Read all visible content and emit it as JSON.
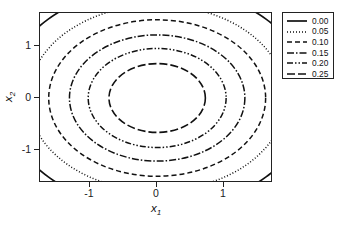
{
  "chart_data": {
    "type": "line",
    "subtype": "contour",
    "title": "",
    "xlabel": "x1",
    "ylabel": "x2",
    "xlabel_base": "x",
    "xlabel_sub": "1",
    "ylabel_base": "x",
    "ylabel_sub": "2",
    "xlim": [
      -1.75,
      1.73
    ],
    "ylim": [
      -1.63,
      1.63
    ],
    "x_ticks": [
      -1,
      0,
      1
    ],
    "x_ticklabels": [
      "-1",
      "0",
      "1"
    ],
    "y_ticks": [
      1,
      0,
      -1
    ],
    "y_ticklabels": [
      "1",
      "0",
      "-1"
    ],
    "grid": false,
    "legend_position": "outside-right-top",
    "legend_title": "",
    "levels": [
      0.0,
      0.05,
      0.1,
      0.15,
      0.2,
      0.25
    ],
    "legend_labels": [
      "0.00",
      "0.05",
      "0.10",
      "0.15",
      "0.20",
      "0.25"
    ],
    "line_styles": [
      "solid",
      "dotted",
      "dashed",
      "dash-dot",
      "dash-dot-dot",
      "long-dash"
    ],
    "line_color": "#111111",
    "contours": [
      {
        "level": "0.00",
        "style": "solid",
        "rx": 2.3,
        "ry": 2.14,
        "cx": 0,
        "cy": 0,
        "dash": "none",
        "width": 1.7
      },
      {
        "level": "0.05",
        "style": "dotted",
        "rx": 1.92,
        "ry": 1.78,
        "cx": 0,
        "cy": 0,
        "dash": "1,2",
        "width": 1.5
      },
      {
        "level": "0.10",
        "style": "dashed",
        "rx": 1.62,
        "ry": 1.5,
        "cx": 0,
        "cy": 0,
        "dash": "5,3",
        "width": 1.5
      },
      {
        "level": "0.15",
        "style": "dash-dot",
        "rx": 1.31,
        "ry": 1.21,
        "cx": 0,
        "cy": 0,
        "dash": "7,2,1.5,2",
        "width": 1.5
      },
      {
        "level": "0.20",
        "style": "dash-dot-dot",
        "rx": 1.03,
        "ry": 0.95,
        "cx": 0,
        "cy": 0,
        "dash": "6,2,1.5,2,1.5,2",
        "width": 1.5
      },
      {
        "level": "0.25",
        "style": "long-dash",
        "rx": 0.72,
        "ry": 0.66,
        "cx": 0,
        "cy": 0,
        "dash": "8,3",
        "width": 1.6
      }
    ]
  }
}
